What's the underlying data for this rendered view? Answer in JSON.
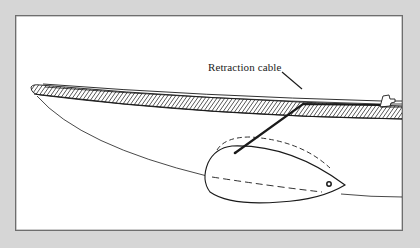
{
  "figure": {
    "type": "technical-illustration",
    "labels": {
      "retraction_cable": "Retraction cable"
    },
    "colors": {
      "background": "#d6d6d6",
      "panel": "#ffffff",
      "border": "#6e6e6e",
      "ink": "#1a1a1a"
    }
  }
}
